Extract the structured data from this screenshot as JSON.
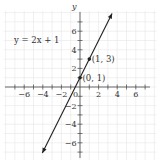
{
  "chart_data": {
    "type": "line",
    "title": "",
    "equation_label": "y = 2x + 1",
    "xlabel": "",
    "ylabel": "y",
    "xlim": [
      -7.5,
      7.5
    ],
    "ylim": [
      -8,
      8
    ],
    "grid": true,
    "x_ticks": [
      -6,
      -4,
      -2,
      2,
      4,
      6
    ],
    "y_ticks": [
      -6,
      -4,
      -2,
      2,
      4,
      6
    ],
    "origin_label": "0",
    "series": [
      {
        "name": "y = 2x + 1",
        "slope": 2,
        "intercept": 1,
        "x": [
          -4.5,
          3.5
        ],
        "y": [
          -8,
          8
        ],
        "arrows_both_ends": true
      }
    ],
    "points": [
      {
        "x": 0,
        "y": 1,
        "label": "(0, 1)"
      },
      {
        "x": 1,
        "y": 3,
        "label": "(1, 3)"
      }
    ]
  },
  "colors": {
    "line": "#222222",
    "axis": "#444444",
    "grid": "#e6e6e6",
    "text": "#333333"
  }
}
